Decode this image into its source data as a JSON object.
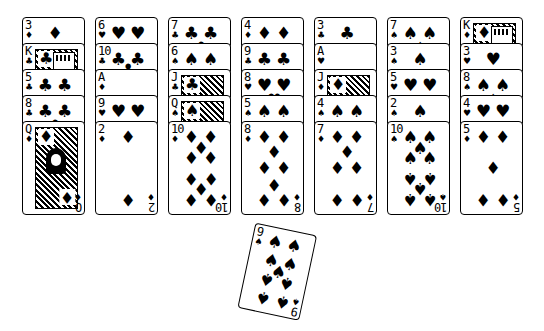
{
  "game": {
    "type": "solitaire-tableau",
    "colors": {
      "background": "#ffffff",
      "ink": "#000000"
    }
  },
  "suits": {
    "spades": "♠",
    "hearts": "♥",
    "diamonds": "♦",
    "clubs": "♣"
  },
  "columns": [
    {
      "cards": [
        {
          "rank": "3",
          "suit": "diamonds"
        },
        {
          "rank": "K",
          "suit": "clubs"
        },
        {
          "rank": "5",
          "suit": "clubs"
        },
        {
          "rank": "8",
          "suit": "clubs"
        },
        {
          "rank": "Q",
          "suit": "diamonds"
        }
      ]
    },
    {
      "cards": [
        {
          "rank": "6",
          "suit": "hearts"
        },
        {
          "rank": "10",
          "suit": "clubs"
        },
        {
          "rank": "A",
          "suit": "diamonds"
        },
        {
          "rank": "9",
          "suit": "hearts"
        },
        {
          "rank": "2",
          "suit": "diamonds"
        }
      ]
    },
    {
      "cards": [
        {
          "rank": "7",
          "suit": "clubs"
        },
        {
          "rank": "6",
          "suit": "spades"
        },
        {
          "rank": "J",
          "suit": "clubs"
        },
        {
          "rank": "Q",
          "suit": "spades"
        },
        {
          "rank": "10",
          "suit": "diamonds"
        }
      ]
    },
    {
      "cards": [
        {
          "rank": "4",
          "suit": "diamonds"
        },
        {
          "rank": "9",
          "suit": "clubs"
        },
        {
          "rank": "8",
          "suit": "hearts"
        },
        {
          "rank": "5",
          "suit": "spades"
        },
        {
          "rank": "8",
          "suit": "diamonds"
        }
      ]
    },
    {
      "cards": [
        {
          "rank": "3",
          "suit": "clubs"
        },
        {
          "rank": "A",
          "suit": "hearts"
        },
        {
          "rank": "J",
          "suit": "diamonds"
        },
        {
          "rank": "4",
          "suit": "spades"
        },
        {
          "rank": "7",
          "suit": "diamonds"
        }
      ]
    },
    {
      "cards": [
        {
          "rank": "7",
          "suit": "spades"
        },
        {
          "rank": "3",
          "suit": "spades"
        },
        {
          "rank": "5",
          "suit": "hearts"
        },
        {
          "rank": "2",
          "suit": "spades"
        },
        {
          "rank": "10",
          "suit": "spades"
        }
      ]
    },
    {
      "cards": [
        {
          "rank": "K",
          "suit": "diamonds"
        },
        {
          "rank": "3",
          "suit": "hearts"
        },
        {
          "rank": "8",
          "suit": "spades"
        },
        {
          "rank": "4",
          "suit": "hearts"
        },
        {
          "rank": "5",
          "suit": "diamonds"
        }
      ]
    }
  ],
  "dragged_card": {
    "rank": "9",
    "suit": "spades",
    "rotation_deg": 12
  }
}
